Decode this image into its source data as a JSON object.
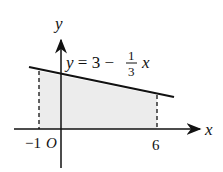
{
  "diagram": {
    "axes": {
      "x_label": "x",
      "y_label": "y",
      "origin_label": "O"
    },
    "ticks": {
      "left": "−1",
      "right": "6"
    },
    "equation": {
      "lhs": "y = 3 −",
      "frac_num": "1",
      "frac_den": "3",
      "var": "x"
    },
    "colors": {
      "line": "#111111",
      "fill": "#ececec",
      "axis": "#111111"
    }
  }
}
